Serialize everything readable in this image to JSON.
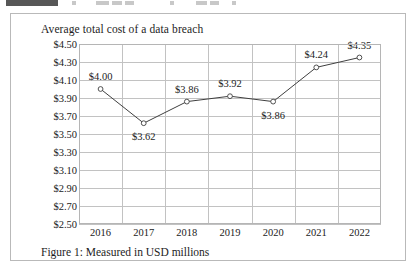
{
  "toolbar": {
    "visible": true,
    "note": "partially cropped application toolbar"
  },
  "figure": {
    "caption": "Figure 1: Measured in USD millions"
  },
  "chart_data": {
    "type": "line",
    "title": "Average total cost of a data breach",
    "xlabel": "",
    "ylabel": "",
    "categories": [
      "2016",
      "2017",
      "2018",
      "2019",
      "2020",
      "2021",
      "2022"
    ],
    "values": [
      4.0,
      3.62,
      3.86,
      3.92,
      3.86,
      4.24,
      4.35
    ],
    "point_labels": [
      "$4.00",
      "$3.62",
      "$3.86",
      "$3.92",
      "$3.86",
      "$4.24",
      "$4.35"
    ],
    "label_positions": [
      "above",
      "below",
      "above",
      "above",
      "below",
      "above",
      "above"
    ],
    "ylim": [
      2.5,
      4.5
    ],
    "ytick_step": 0.2,
    "ytick_labels": [
      "$4.50",
      "$4.30",
      "$4.10",
      "$3.90",
      "$3.70",
      "$3.50",
      "$3.30",
      "$3.10",
      "$2.90",
      "$2.70",
      "$2.50"
    ],
    "ytick_values": [
      4.5,
      4.3,
      4.1,
      3.9,
      3.7,
      3.5,
      3.3,
      3.1,
      2.9,
      2.7,
      2.5
    ],
    "grid": true,
    "legend": false,
    "marker": "open-circle",
    "line_color": "#3f3f3f",
    "grid_color": "#c2c2c2",
    "marker_fill": "#ffffff"
  }
}
